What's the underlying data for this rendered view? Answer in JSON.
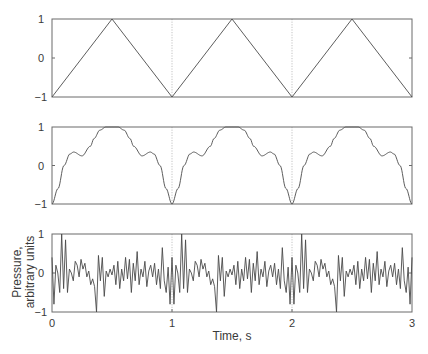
{
  "chart_data": [
    {
      "type": "line",
      "panel": "top",
      "title": "",
      "description": "Triangle wave, period 1 s",
      "x": [
        0,
        0.5,
        1.0,
        1.5,
        2.0,
        2.5,
        3.0
      ],
      "values": [
        -1,
        1,
        -1,
        1,
        -1,
        1,
        -1
      ],
      "xlim": [
        0,
        3
      ],
      "ylim": [
        -1,
        1
      ],
      "yticks": [
        "1",
        "0",
        "−1"
      ],
      "xlabel": "",
      "ylabel": "",
      "gridlines_x": [
        1,
        2
      ]
    },
    {
      "type": "line",
      "panel": "middle",
      "title": "",
      "description": "Band-limited approximation of triangle wave (period 1 s); one period sampled",
      "period_x": [
        0,
        0.05,
        0.1,
        0.15,
        0.18,
        0.25,
        0.32,
        0.35,
        0.4,
        0.45,
        0.5,
        0.55,
        0.6,
        0.65,
        0.68,
        0.75,
        0.82,
        0.85,
        0.9,
        0.95,
        1.0
      ],
      "period_values": [
        -1,
        -0.6,
        0.0,
        0.3,
        0.35,
        0.25,
        0.5,
        0.7,
        0.92,
        1.0,
        1.0,
        1.0,
        0.92,
        0.7,
        0.5,
        0.25,
        0.35,
        0.3,
        0.0,
        -0.6,
        -1
      ],
      "xlim": [
        0,
        3
      ],
      "ylim": [
        -1,
        1
      ],
      "yticks": [
        "1",
        "0",
        "−1"
      ],
      "xlabel": "",
      "ylabel": "",
      "gridlines_x": [
        1,
        2
      ]
    },
    {
      "type": "line",
      "panel": "bottom",
      "title": "",
      "description": "Periodic noise waveform repeating every 1 s",
      "period_values": [
        0.4,
        -0.8,
        0.2,
        0.0,
        -0.5,
        1.0,
        -0.4,
        0.85,
        -0.5,
        0.1,
        0.0,
        -0.2,
        0.3,
        0.2,
        -0.1,
        0.35,
        0.1,
        0.25,
        -0.1,
        0.05,
        -0.3,
        -0.15,
        -0.35,
        -1.0,
        0.45,
        -0.2,
        0.4,
        -0.6,
        0.05,
        -0.1,
        0.1,
        -0.05,
        0.2,
        -0.3,
        0.3,
        -0.4,
        0.1,
        -0.2,
        0.4,
        -0.15,
        0.35,
        -0.5,
        0.25,
        -0.2,
        0.55,
        -0.3,
        0.1,
        -0.1,
        0.3,
        -0.35,
        0.05,
        0.2,
        -0.1,
        0.25,
        -0.3,
        0.1,
        -0.4,
        0.65,
        -0.2,
        -0.5,
        0.15,
        -0.8
      ],
      "xlim": [
        0,
        3
      ],
      "ylim": [
        -1,
        1
      ],
      "yticks": [
        "1",
        "0",
        "−1"
      ],
      "xticks": [
        "0",
        "1",
        "2",
        "3"
      ],
      "xlabel": "Time, s",
      "ylabel": "Pressure, arbitrary units",
      "gridlines_x": [
        1,
        2
      ]
    }
  ],
  "labels": {
    "ytick_top": "1",
    "ytick_mid": "0",
    "ytick_bot": "−1",
    "xtick_0": "0",
    "xtick_1": "1",
    "xtick_2": "2",
    "xtick_3": "3",
    "xlabel": "Time, s",
    "ylabel_line1": "Pressure,",
    "ylabel_line2": "arbitrary units"
  }
}
